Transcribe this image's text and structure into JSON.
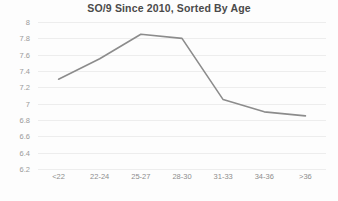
{
  "chart_data": {
    "type": "line",
    "title": "SO/9 Since 2010, Sorted By Age",
    "xlabel": "",
    "ylabel": "",
    "categories": [
      "<22",
      "22-24",
      "25-27",
      "28-30",
      "31-33",
      "34-36",
      ">36"
    ],
    "values": [
      7.3,
      7.55,
      7.85,
      7.8,
      7.05,
      6.9,
      6.85
    ],
    "ylim": [
      6.2,
      8.0
    ],
    "yticks": [
      "6.2",
      "6.4",
      "6.6",
      "6.8",
      "7",
      "7.2",
      "7.4",
      "7.6",
      "7.8",
      "8"
    ],
    "ytick_values": [
      6.2,
      6.4,
      6.6,
      6.8,
      7.0,
      7.2,
      7.4,
      7.6,
      7.8,
      8.0
    ],
    "grid": true,
    "legend": false,
    "series_color": "#8c8c8c",
    "grid_color": "#ededed",
    "markers": false
  }
}
